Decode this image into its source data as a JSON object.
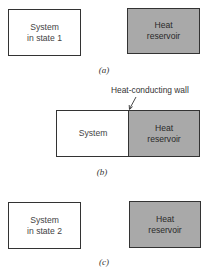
{
  "panels": [
    {
      "id": "a",
      "caption": "(a)",
      "system_label": "System\nin state 1",
      "reservoir_label": "Heat\nreservoir"
    },
    {
      "id": "b",
      "caption": "(b)",
      "system_label": "System",
      "reservoir_label": "Heat\nreservoir",
      "wall_label": "Heat-conducting wall"
    },
    {
      "id": "c",
      "caption": "(c)",
      "system_label": "System\nin state 2",
      "reservoir_label": "Heat\nreservoir"
    }
  ],
  "colors": {
    "reservoir_fill": "#a9a9a9",
    "system_fill": "#ffffff",
    "outline": "#333333"
  }
}
